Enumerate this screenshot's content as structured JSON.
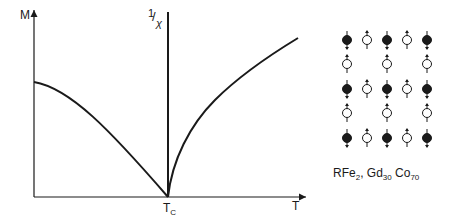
{
  "figure": {
    "left_axis_label": "M",
    "right_axis_label_num": "1",
    "right_axis_label_den": "χ",
    "x_axis_label": "T",
    "critical_label_main": "T",
    "critical_label_sub": "C",
    "caption": {
      "part1": "RFe",
      "part1_sub": "2",
      "sep": ", Gd",
      "part2_sub": "30",
      "part3": " Co",
      "part3_sub": "70"
    }
  },
  "spin_lattice": {
    "rows": [
      [
        "filled-down",
        "open-up",
        "filled-down",
        "open-up",
        "filled-down"
      ],
      [
        "open-up",
        "",
        "open-up",
        "",
        "open-up"
      ],
      [
        "filled-down",
        "open-up",
        "filled-down",
        "open-up",
        "filled-down"
      ],
      [
        "open-up",
        "",
        "open-up",
        "",
        "open-up"
      ],
      [
        "filled-down",
        "open-up",
        "filled-down",
        "open-up",
        "filled-down"
      ]
    ]
  },
  "chart_data": {
    "type": "line",
    "title": "",
    "xlabel": "T",
    "ylabel": "M",
    "y2label": "1/χ",
    "annotations": [
      "T_C",
      "RFe2, Gd30 Co70"
    ],
    "series": [
      {
        "name": "M",
        "x": [
          0,
          0.25,
          0.5,
          0.75,
          1.0
        ],
        "y": [
          0.62,
          0.52,
          0.37,
          0.19,
          0.0
        ]
      },
      {
        "name": "1/χ",
        "x": [
          1.0,
          1.25,
          1.5,
          1.75,
          1.97
        ],
        "y": [
          0.0,
          0.46,
          0.67,
          0.83,
          0.95
        ]
      }
    ],
    "grid": false
  }
}
